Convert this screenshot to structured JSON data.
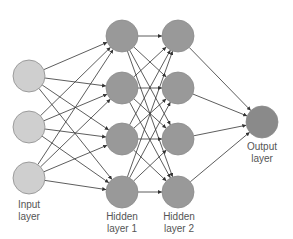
{
  "diagram": {
    "type": "feed-forward neural network",
    "colors": {
      "input_fill": "#cfcfcf",
      "hidden_fill": "#999999",
      "output_fill": "#8a8a8a",
      "node_stroke": "#8c8c8c",
      "edge": "#333333"
    },
    "layers": [
      {
        "id": "input",
        "label_line1": "Input",
        "label_line2": "layer",
        "nodes": 3
      },
      {
        "id": "hidden1",
        "label_line1": "Hidden",
        "label_line2": "layer 1",
        "nodes": 4
      },
      {
        "id": "hidden2",
        "label_line1": "Hidden",
        "label_line2": "layer 2",
        "nodes": 4
      },
      {
        "id": "output",
        "label_line1": "Output",
        "label_line2": "layer",
        "nodes": 1
      }
    ],
    "connectivity": "fully-connected between consecutive layers, directed left to right"
  }
}
